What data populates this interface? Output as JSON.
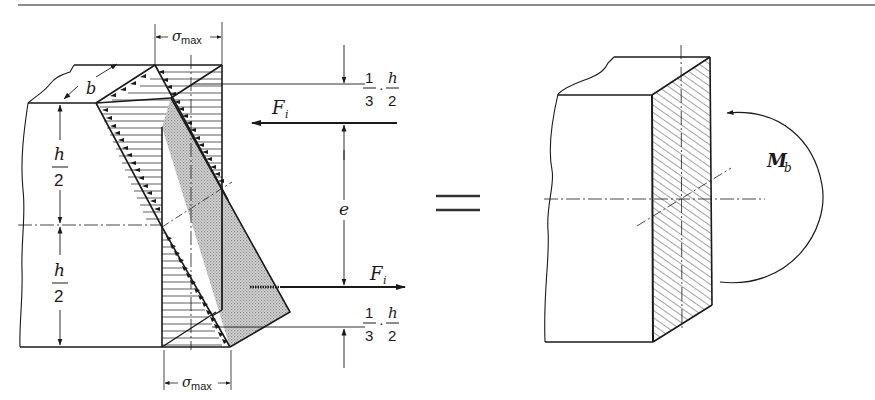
{
  "figure": {
    "left": {
      "labels": {
        "b": "b",
        "sigma_max_top": "σ",
        "sigma_max_top_sub": "max",
        "sigma_max_bottom": "σ",
        "sigma_max_bottom_sub": "max",
        "h_upper_num": "h",
        "h_upper_den": "2",
        "h_lower_num": "h",
        "h_lower_den": "2",
        "e": "e",
        "F_top": "F",
        "F_top_sub": "i",
        "F_bottom": "F",
        "F_bottom_sub": "i",
        "third_top_num1": "1",
        "third_top_den1": "3",
        "third_top_num2": "h",
        "third_top_den2": "2",
        "third_bottom_num1": "1",
        "third_bottom_den1": "3",
        "third_bottom_num2": "h",
        "third_bottom_den2": "2",
        "dot": "·"
      }
    },
    "equals": "=",
    "right": {
      "labels": {
        "moment": "M",
        "moment_sub": "b"
      }
    }
  },
  "colors": {
    "ink": "#1a1a1a",
    "shade": "#c9c9c9",
    "background": "#ffffff"
  }
}
